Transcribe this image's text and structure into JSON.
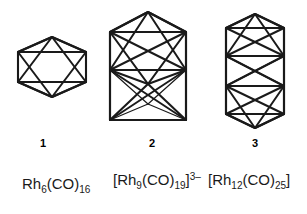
{
  "figure": {
    "kind": "chemical-structure-diagram",
    "background_color": "#ffffff",
    "line_color": "#1a1a1a"
  },
  "structures": [
    {
      "id": "octahedron",
      "label": "1",
      "shape": "octahedron",
      "vertex_count": 6,
      "formula": {
        "prefix": "",
        "metal": "Rh",
        "metal_count": "6",
        "ligand": "(CO)",
        "ligand_count": "16",
        "suffix": "",
        "charge": ""
      }
    },
    {
      "id": "capped-square-antiprism",
      "label": "2",
      "shape": "capped polyhedron",
      "vertex_count": 9,
      "formula": {
        "prefix": "[",
        "metal": "Rh",
        "metal_count": "9",
        "ligand": "(CO)",
        "ligand_count": "19",
        "suffix": "]",
        "charge": "3–"
      }
    },
    {
      "id": "stacked-octahedra",
      "label": "3",
      "shape": "fused double polyhedron",
      "vertex_count": 12,
      "formula": {
        "prefix": "[",
        "metal": "Rh",
        "metal_count": "12",
        "ligand": "(CO)",
        "ligand_count": "25",
        "suffix": "]",
        "charge": ""
      }
    }
  ]
}
